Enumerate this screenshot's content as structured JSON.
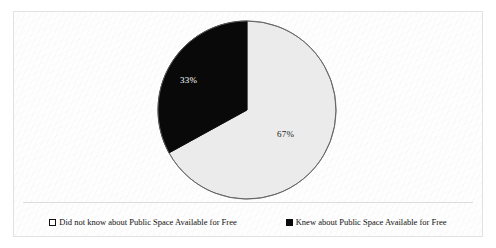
{
  "chart_data": {
    "type": "pie",
    "title": "",
    "subtitle": "",
    "xlabel": "",
    "ylabel": "",
    "legend_position": "bottom",
    "grid": false,
    "start_angle_deg": 0,
    "direction": "clockwise",
    "categories": [
      "Did not know about Public Space Available for Free",
      "Knew about Public Space Available for Free"
    ],
    "values": [
      67,
      33
    ],
    "unit": "%",
    "slices": [
      {
        "label": "Did not know about Public Space Available for Free",
        "value": 67,
        "data_label": "67%",
        "color": "#ebebeb",
        "stroke": "#555555"
      },
      {
        "label": "Knew about Public Space Available for Free",
        "value": 33,
        "data_label": "33%",
        "color": "#090909",
        "stroke": "#090909"
      }
    ]
  },
  "legend": {
    "items": [
      {
        "marker": "open-square",
        "label": "Did not know about Public Space Available for Free"
      },
      {
        "marker": "filled-square",
        "label": "Knew about Public Space Available for Free"
      }
    ]
  },
  "colors": {
    "frame_border": "#e2e2e2",
    "background": "#ffffff",
    "slice_light": "#ebebeb",
    "slice_dark": "#090909",
    "outline": "#555555",
    "divider": "#dcdcdc"
  }
}
